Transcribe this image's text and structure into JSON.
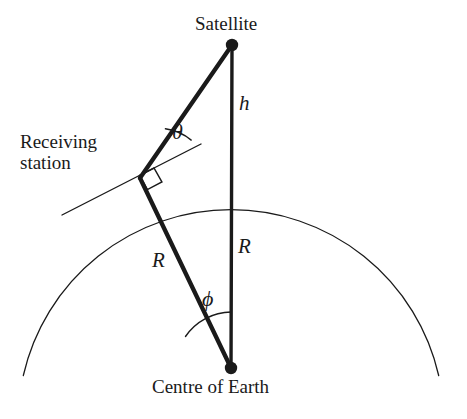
{
  "figure": {
    "background_color": "#ffffff",
    "ink_color": "#1a1a1a"
  },
  "labels": {
    "satellite": "Satellite",
    "centre_of_earth": "Centre of Earth",
    "receiving_station_line1": "Receiving",
    "receiving_station_line2": "station",
    "height_symbol": "h",
    "radius_symbol_vertical": "R",
    "radius_symbol_slant": "R",
    "angle_theta": "θ",
    "angle_phi": "ϕ"
  },
  "geometry": {
    "satellite_point": {
      "x": 232,
      "y": 45
    },
    "centre_of_earth_point": {
      "x": 231,
      "y": 368
    },
    "receiving_station_point": {
      "x": 140,
      "y": 178
    },
    "earth_circle": {
      "cx": 231,
      "cy": 368,
      "r": 213
    },
    "tangent_line": {
      "x1": 62,
      "y1": 215,
      "x2": 201,
      "y2": 144
    },
    "theta_arc_radius": 52,
    "phi_arc_radius": 56,
    "right_angle_marker_size": 16,
    "point_marker_radius": 6,
    "thick_stroke_width": 4.2,
    "thin_stroke_width": 1.3
  }
}
